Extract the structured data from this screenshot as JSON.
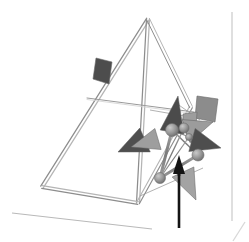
{
  "scene": {
    "title": "3D tetrahedral truss structure with manipulator node cluster",
    "background_color": "#ffffff",
    "width": 249,
    "height": 242,
    "render_style": "wireframe-3d-viewport",
    "projection": "perspective"
  },
  "palette": {
    "background": "#ffffff",
    "truss_stroke": "#8d8d8d",
    "truss_stroke_light": "#b5b5b5",
    "thin_line": "#9a9a9a",
    "ground_line": "#b9b9b9",
    "border_line": "#d2d2d2",
    "cone_dark": "#4a4a4a",
    "cone_mid": "#7d7d7d",
    "cone_light": "#a8a8a8",
    "plate_dark": "#4d4d4d",
    "plate_mid": "#8f8f8f",
    "plate_light": "#a5a5a5",
    "node_sphere": "#949494",
    "node_sphere_edge": "#6d6d6d",
    "strut": "#7a7a7a",
    "arrow_black": "#141414"
  },
  "truss": {
    "name": "triangular-truss-frame",
    "description": "Large triangular frame drawn as paired tube outlines with a horizontal crossbar",
    "apex": {
      "x": 148,
      "y": 19
    },
    "left_base": {
      "x": 42,
      "y": 187
    },
    "right_base": {
      "x": 138,
      "y": 203
    },
    "right_upper": {
      "x": 191,
      "y": 107
    },
    "crossbar_left": {
      "x": 87,
      "y": 98
    },
    "crossbar_right": {
      "x": 194,
      "y": 112
    },
    "tube_offset_px": 3
  },
  "ground": {
    "name": "ground-reference-line",
    "start": {
      "x": 12,
      "y": 213
    },
    "end": {
      "x": 152,
      "y": 229
    }
  },
  "viewport_border": {
    "name": "viewport-right-border",
    "vertical_line_x": 232,
    "vertical_top": 12,
    "vertical_bottom": 221,
    "diagonal_start": {
      "x": 233,
      "y": 241
    },
    "diagonal_end": {
      "x": 245,
      "y": 222
    }
  },
  "node_cluster": {
    "name": "manipulator-node-cluster",
    "description": "Cluster of spherical joints linked by struts at the right side of the truss",
    "nodes": [
      {
        "id": "n1",
        "x": 172,
        "y": 130,
        "r": 6.5,
        "shade": "#9a9a9a"
      },
      {
        "id": "n2",
        "x": 184,
        "y": 128,
        "r": 5.0,
        "shade": "#8e8e8e"
      },
      {
        "id": "n3",
        "x": 198,
        "y": 155,
        "r": 6.0,
        "shade": "#949494"
      },
      {
        "id": "n4",
        "x": 160,
        "y": 178,
        "r": 5.5,
        "shade": "#8a8a8a"
      },
      {
        "id": "n5",
        "x": 189,
        "y": 137,
        "r": 3.5,
        "shade": "#a0a0a0"
      }
    ],
    "struts": [
      {
        "from": "n1",
        "to": "n4",
        "width": 3.0
      },
      {
        "from": "n1",
        "to": "n2",
        "width": 2.2
      },
      {
        "from": "n2",
        "to": "n3",
        "width": 2.0
      },
      {
        "from": "n3",
        "to": "n4",
        "width": 3.0
      },
      {
        "from": "n1",
        "to": "n3",
        "width": 1.6
      },
      {
        "from": "n2",
        "to": "n4",
        "width": 1.4
      },
      {
        "from": "n1",
        "to": "n5",
        "width": 1.2
      },
      {
        "from": "n5",
        "to": "n4",
        "width": 1.2
      }
    ]
  },
  "cones": [
    {
      "name": "cone-left-outer",
      "tip": {
        "x": 118,
        "y": 152
      },
      "base_center": {
        "x": 145,
        "y": 140
      },
      "half_width": 13,
      "fill": "#4f4f4f",
      "label": "left-pointing vector"
    },
    {
      "name": "cone-left-inner",
      "tip": {
        "x": 131,
        "y": 147
      },
      "base_center": {
        "x": 158,
        "y": 139
      },
      "half_width": 11,
      "fill": "#9e9e9e",
      "label": "left-pointing vector"
    },
    {
      "name": "cone-up-center",
      "tip": {
        "x": 178,
        "y": 96
      },
      "base_center": {
        "x": 172,
        "y": 132
      },
      "half_width": 12,
      "fill": "#4b4b4b",
      "label": "upward vector"
    },
    {
      "name": "cone-right-upper",
      "tip": {
        "x": 213,
        "y": 122
      },
      "base_center": {
        "x": 186,
        "y": 131
      },
      "half_width": 12,
      "fill": "#9c9c9c",
      "label": "right-upper vector"
    },
    {
      "name": "cone-right-lower",
      "tip": {
        "x": 221,
        "y": 148
      },
      "base_center": {
        "x": 192,
        "y": 140
      },
      "half_width": 12,
      "fill": "#4e4e4e",
      "label": "right-lower vector"
    },
    {
      "name": "cone-down-right",
      "tip": {
        "x": 196,
        "y": 200
      },
      "base_center": {
        "x": 183,
        "y": 172
      },
      "half_width": 12,
      "fill": "#a3a3a3",
      "label": "down-right vector"
    }
  ],
  "plates": [
    {
      "name": "plate-upper-left-dark",
      "points": "96,58 112,62 109,84 93,79",
      "fill": "#4d4d4d",
      "label": "dark quad plate on left truss edge"
    },
    {
      "name": "plate-right-large-gray",
      "points": "197,96 218,99 215,122 195,118",
      "fill": "#8c8c8c",
      "label": "gray quad plate at right of cluster"
    },
    {
      "name": "plate-right-small-gray",
      "points": "183,114 197,112 196,127 183,128",
      "fill": "#9d9d9d",
      "label": "small gray quad plate"
    }
  ],
  "black_arrow": {
    "name": "reference-force-arrow",
    "description": "Solid black arrow pointing up from the bottom of the viewport into the node cluster",
    "shaft_x": 179,
    "shaft_bottom_y": 228,
    "shaft_top_y": 172,
    "shaft_width": 2.6,
    "head_tip": {
      "x": 179,
      "y": 155
    },
    "head_half_width": 6,
    "head_base_y": 174,
    "color": "#141414"
  },
  "thin_links": [
    {
      "name": "thin-link-crossbar-to-node",
      "from": {
        "x": 150,
        "y": 110
      },
      "to": {
        "x": 196,
        "y": 118
      }
    },
    {
      "name": "thin-link-node-to-base",
      "from": {
        "x": 140,
        "y": 196
      },
      "to": {
        "x": 203,
        "y": 168
      }
    },
    {
      "name": "thin-link-upper-diagonal",
      "from": {
        "x": 176,
        "y": 103
      },
      "to": {
        "x": 200,
        "y": 120
      }
    }
  ]
}
